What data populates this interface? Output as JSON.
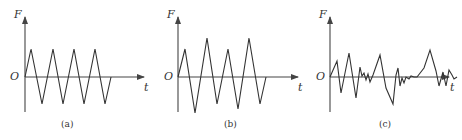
{
  "panels": [
    {
      "id": "a",
      "caption": "(a)",
      "y_label": "F",
      "x_label": "t",
      "origin_label": "O",
      "description": "Constant-amplitude triangular (symmetric alternating) load",
      "waveform_points": "25,77 31,49 42,104 53,49 63,104 74,49 84,104 95,49 105,104 111,77"
    },
    {
      "id": "b",
      "caption": "(b)",
      "y_label": "F",
      "x_label": "t",
      "origin_label": "O",
      "description": "Variable-amplitude triangular load",
      "waveform_points": "178,77 185,49 195,113 207,38 217,104 228,49 238,109 249,38 260,104 266,77"
    },
    {
      "id": "c",
      "caption": "(c)",
      "y_label": "F",
      "x_label": "t",
      "origin_label": "O",
      "description": "Random load",
      "waveform_points": "330,77 337,61 341,93 349,53 356,98 360,67 362,76 364,73 366,80 368,74 370,82 373,75 380,55 386,88 393,104 396,75 398,68 400,86 402,78 404,83 406,77 409,79 411,76 414,77 417,77 424,68 430,50 436,71 439,86 443,72 446,86 449,70 452,75 454,79 457,77"
    }
  ]
}
